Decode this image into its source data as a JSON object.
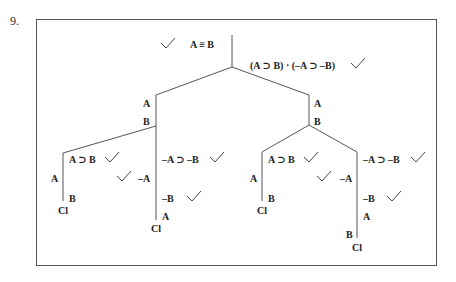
{
  "problem": {
    "number": "9."
  },
  "tree": {
    "premise": "A ≡ B",
    "negated_conclusion": "(A ⊃ B) · (–A ⊃ –B)",
    "left_branch": {
      "lines": [
        "A",
        "B"
      ],
      "left_child": {
        "decomposed": "A ⊃ B",
        "left_leaf": {
          "lines": [
            "A"
          ],
          "closed": "Cl"
        },
        "right_leaf": {
          "lines": [
            "B"
          ],
          "closed": "Cl"
        }
      },
      "right_child": {
        "decomposed": "–A ⊃ –B",
        "left_leaf": {
          "lines": [
            "–A"
          ]
        },
        "right_leaf": {
          "lines": [
            "–B",
            "A"
          ],
          "closed": "Cl"
        }
      }
    },
    "right_branch": {
      "lines": [
        "A",
        "B"
      ],
      "left_child": {
        "decomposed": "A ⊃ B",
        "left_leaf": {
          "lines": [
            "A"
          ],
          "closed": "Cl"
        },
        "right_leaf": {
          "lines": [
            "B"
          ],
          "closed": "Cl"
        }
      },
      "right_child": {
        "decomposed": "–A ⊃ –B",
        "left_leaf": {
          "lines": [
            "–A"
          ]
        },
        "right_leaf": {
          "lines": [
            "–B",
            "A",
            "B"
          ],
          "closed": "Cl"
        }
      }
    }
  },
  "colors": {
    "line": "#555555",
    "text": "#222222",
    "check": "#444444"
  }
}
